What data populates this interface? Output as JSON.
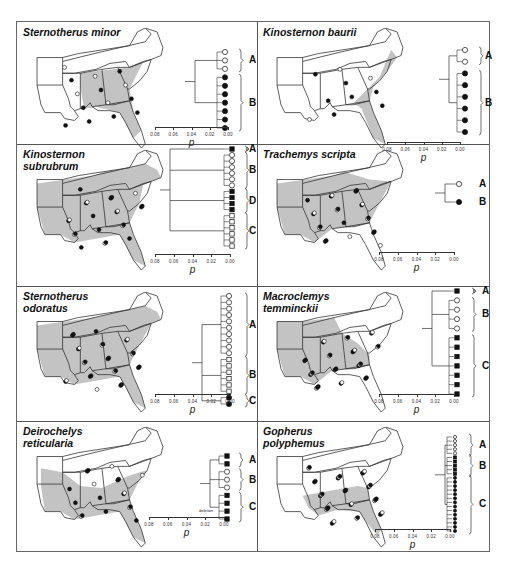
{
  "figure": {
    "axis_ticks": [
      "0.08",
      "0.06",
      "0.04",
      "0.02",
      "0.00"
    ],
    "axis_label": "p",
    "colors": {
      "range_shade": "#bdbdbd",
      "range_shade_dark": "#9a9a9a",
      "outline": "#333333",
      "filled": "#111111",
      "open": "#ffffff"
    }
  },
  "panels": [
    {
      "id": "sternotherus-minor",
      "title": "Sternotherus minor",
      "clades": [
        "A",
        "B"
      ],
      "clade_symbols": [
        [
          "open-circle",
          3
        ],
        [
          "filled-circle",
          7
        ]
      ]
    },
    {
      "id": "kinosternon-baurii",
      "title": "Kinosternon baurii",
      "clades": [
        "A",
        "B"
      ],
      "clade_symbols": [
        [
          "open-circle",
          2
        ],
        [
          "filled-circle",
          6
        ]
      ]
    },
    {
      "id": "kinosternon-subrubrum",
      "title": "Kinosternon\nsubrubrum",
      "clades": [
        "A",
        "B",
        "D",
        "C"
      ],
      "clade_symbols": [
        [
          "filled-square",
          1
        ],
        [
          "open-circle",
          6
        ],
        [
          "filled-square",
          4
        ],
        [
          "open-square",
          6
        ]
      ]
    },
    {
      "id": "trachemys-scripta",
      "title": "Trachemys scripta",
      "clades": [
        "A",
        "B"
      ],
      "clade_symbols": [
        [
          "open-circle",
          1
        ],
        [
          "filled-circle",
          1
        ]
      ]
    },
    {
      "id": "sternotherus-odoratus",
      "title": "Sternotherus\nodoratus",
      "clades": [
        "A",
        "B",
        "C"
      ],
      "clade_symbols": [
        [
          "open-circle",
          10
        ],
        [
          "open-square",
          6
        ],
        [
          "filled-circle",
          2
        ]
      ]
    },
    {
      "id": "macroclemys-temminckii",
      "title": "Macroclemys\ntemminckii",
      "clades": [
        "A",
        "B",
        "C"
      ],
      "clade_symbols": [
        [
          "filled-square",
          1
        ],
        [
          "open-circle",
          4
        ],
        [
          "filled-square",
          7
        ]
      ]
    },
    {
      "id": "deirochelys-reticularia",
      "title": "Deirochelys\nreticularia",
      "clades": [
        "A",
        "B",
        "C"
      ],
      "clade_symbols": [
        [
          "filled-square",
          2
        ],
        [
          "open-circle",
          3
        ],
        [
          "filled-square",
          4
        ]
      ],
      "note": "deletion"
    },
    {
      "id": "gopherus-polyphemus",
      "title": "Gopherus\npolyphemus",
      "clades": [
        "A",
        "B",
        "C"
      ],
      "clade_symbols": [
        [
          "open-circle",
          5
        ],
        [
          "filled-square",
          5
        ],
        [
          "filled-circle",
          14
        ]
      ]
    }
  ]
}
